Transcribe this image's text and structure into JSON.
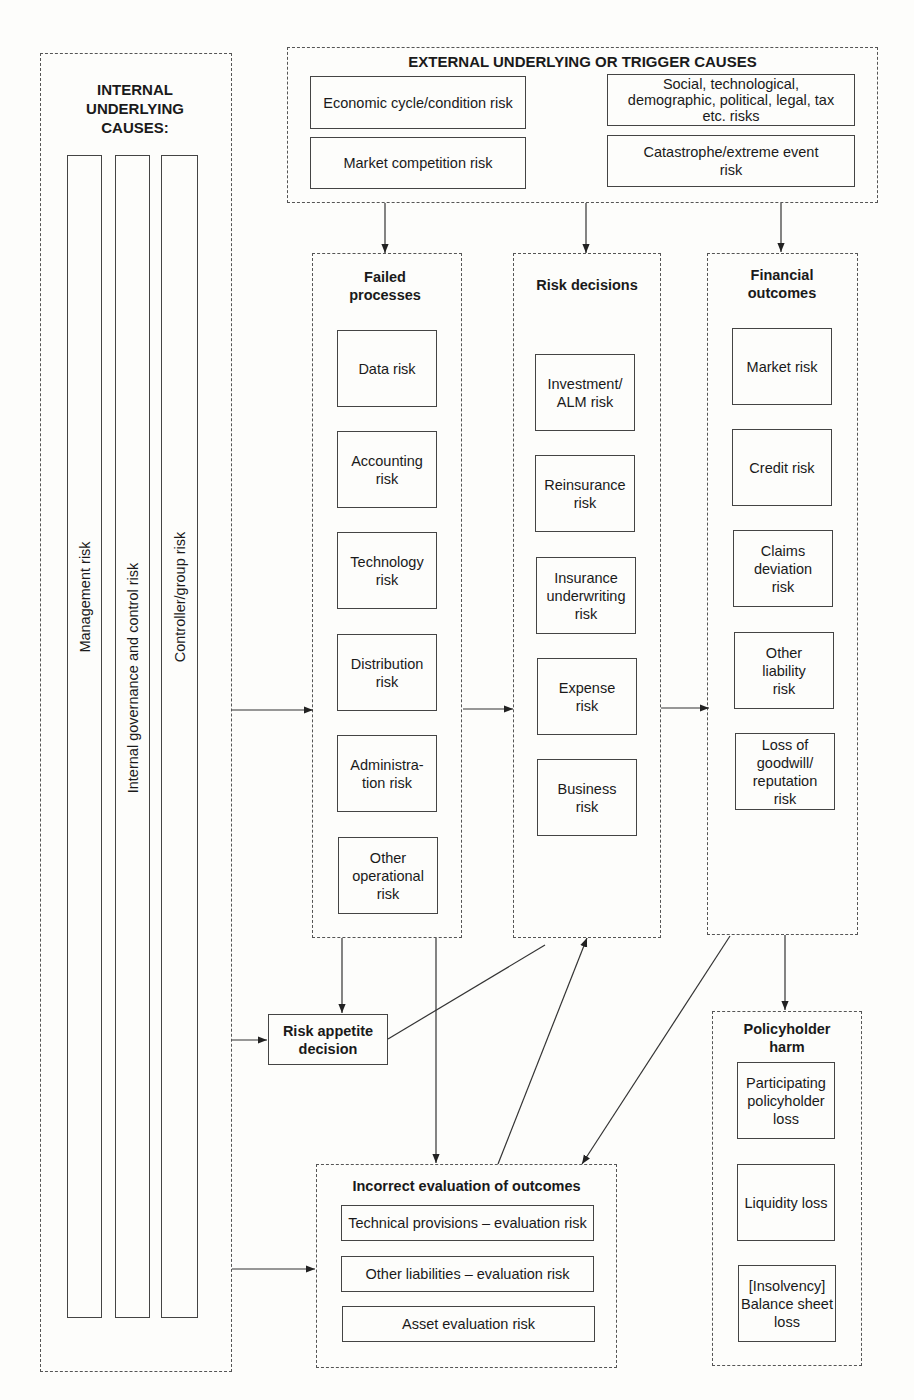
{
  "internal": {
    "title": "INTERNAL UNDERLYING CAUSES:",
    "bars": [
      "Management risk",
      "Internal governance and control risk",
      "Controller/group risk"
    ]
  },
  "external": {
    "title": "EXTERNAL UNDERLYING OR TRIGGER CAUSES",
    "items": [
      "Economic cycle/condition risk",
      "Social, technological, demographic, political, legal, tax etc. risks",
      "Market competition risk",
      "Catastrophe/extreme event risk"
    ]
  },
  "failed_processes": {
    "title": "Failed processes",
    "items": [
      "Data risk",
      "Accounting risk",
      "Technology risk",
      "Distribution risk",
      "Administra-tion risk",
      "Other operational risk"
    ]
  },
  "risk_decisions": {
    "title": "Risk decisions",
    "items": [
      "Investment/ ALM risk",
      "Reinsurance risk",
      "Insurance underwriting risk",
      "Expense risk",
      "Business risk"
    ]
  },
  "financial_outcomes": {
    "title": "Financial outcomes",
    "items": [
      "Market risk",
      "Credit risk",
      "Claims deviation risk",
      "Other liability risk",
      "Loss of goodwill/ reputation risk"
    ]
  },
  "risk_appetite": {
    "title": "Risk appetite decision"
  },
  "incorrect_evaluation": {
    "title": "Incorrect evaluation of outcomes",
    "items": [
      "Technical provisions – evaluation risk",
      "Other liabilities – evaluation risk",
      "Asset evaluation risk"
    ]
  },
  "policyholder_harm": {
    "title": "Policyholder harm",
    "items": [
      "Participating policyholder loss",
      "Liquidity loss",
      "[Insolvency] Balance sheet loss"
    ]
  },
  "colors": {
    "line": "#333333",
    "background": "#fdfdfb"
  }
}
